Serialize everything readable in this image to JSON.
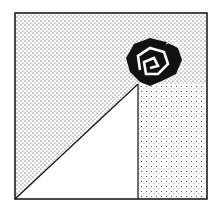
{
  "illustration": {
    "subject": "stippled square with diagonal and rose",
    "colors": {
      "background": "#ffffff",
      "ink": "#111111"
    },
    "frame": {
      "x": 15,
      "y": 13,
      "width": 192,
      "height": 186
    },
    "diagonal": {
      "x1": 15,
      "y1": 199,
      "x2": 138,
      "y2": 84
    },
    "vertical": {
      "x": 138,
      "y1": 84,
      "y2": 199
    },
    "rose": {
      "cx": 152,
      "cy": 62
    }
  }
}
